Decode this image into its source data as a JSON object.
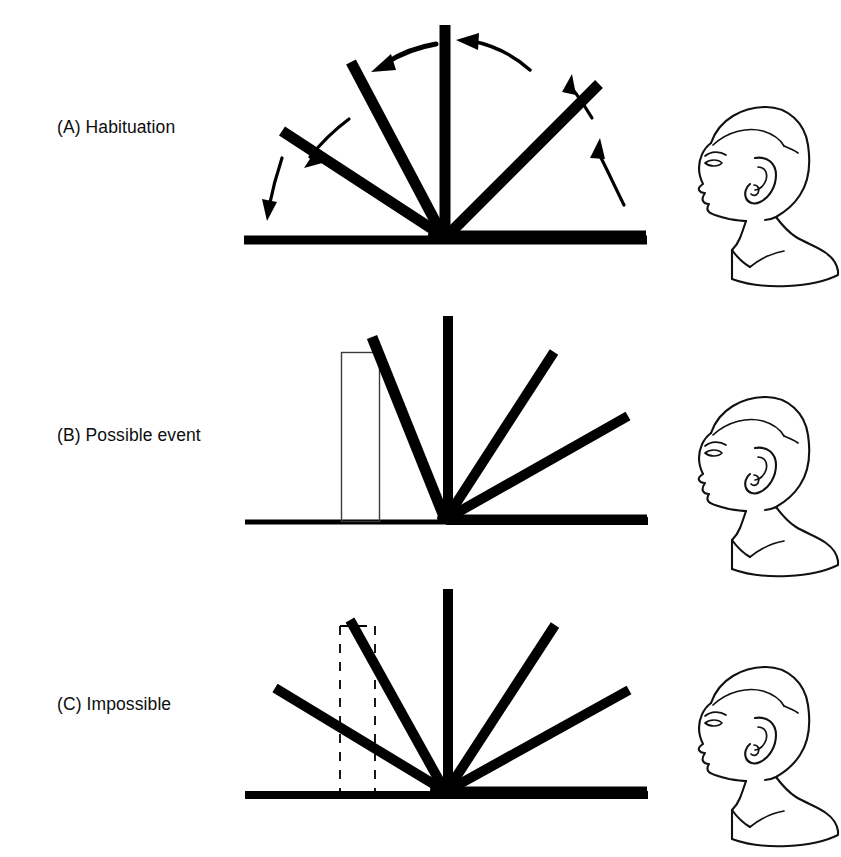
{
  "figure": {
    "background_color": "#ffffff",
    "ink_color": "#000000",
    "width": 841,
    "height": 857
  },
  "panels": [
    {
      "id": "A",
      "label": "(A) Habituation",
      "description": "Screen rotates through a full 180 degree arc with no obstacle",
      "screen_angles_deg": [
        0,
        45,
        90,
        135,
        180
      ],
      "screen_count": 5,
      "has_box": false,
      "box_style": "none",
      "arrows": 4,
      "arrow_direction": "counterclockwise",
      "ground_line_y": 240,
      "pivot_x": 445,
      "screen_length": 215
    },
    {
      "id": "B",
      "label": "(B) Possible event",
      "description": "Screen stops when it reaches the solid box behind it",
      "screen_angles_deg": [
        0,
        30,
        60,
        90,
        112
      ],
      "screen_count": 5,
      "has_box": true,
      "box_style": "solid-outline",
      "arrows": 0,
      "arrow_direction": "none",
      "ground_line_y": 522,
      "pivot_x": 445,
      "screen_length": 215
    },
    {
      "id": "C",
      "label": "(C) Impossible",
      "description": "Screen rotates through the space where the box should be; box shown as dashed outline",
      "screen_angles_deg": [
        0,
        38,
        72,
        90,
        155
      ],
      "screen_count": 5,
      "has_box": true,
      "box_style": "dashed-outline",
      "arrows": 0,
      "arrow_direction": "none",
      "ground_line_y": 795,
      "pivot_x": 445,
      "screen_length": 215
    }
  ],
  "observers": [
    {
      "id": "baby-a",
      "name": "infant-head-profile",
      "facing": "left",
      "panel": "A"
    },
    {
      "id": "baby-b",
      "name": "infant-head-profile",
      "facing": "left",
      "panel": "B"
    },
    {
      "id": "baby-c",
      "name": "infant-head-profile",
      "facing": "left",
      "panel": "C"
    }
  ]
}
